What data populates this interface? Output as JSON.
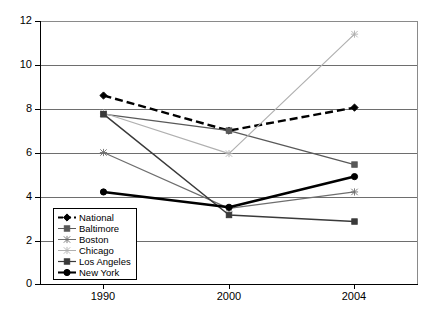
{
  "chart_data": {
    "type": "line",
    "title": "",
    "xlabel": "",
    "ylabel": "",
    "categories": [
      "1990",
      "2000",
      "2004"
    ],
    "ylim": [
      0,
      12
    ],
    "yticks": [
      0,
      2,
      4,
      6,
      8,
      10,
      12
    ],
    "ytick_labels": [
      "0",
      "2",
      "4",
      "6",
      "8",
      "10",
      "12"
    ],
    "grid": true,
    "grid_axis": "y",
    "legend_position": "lower-left-inside",
    "series": [
      {
        "name": "National",
        "values": [
          8.6,
          7.0,
          8.05
        ],
        "color": "#000000",
        "line_style": "dashed",
        "line_width": 2.4,
        "marker": "diamond"
      },
      {
        "name": "Baltimore",
        "values": [
          7.75,
          7.0,
          5.45
        ],
        "color": "#595959",
        "line_style": "solid",
        "line_width": 1.3,
        "marker": "square"
      },
      {
        "name": "Boston",
        "values": [
          6.0,
          3.45,
          4.2
        ],
        "color": "#6e6e6e",
        "line_style": "solid",
        "line_width": 1.2,
        "marker": "star"
      },
      {
        "name": "Chicago",
        "values": [
          7.8,
          5.95,
          11.4
        ],
        "color": "#b0b0b0",
        "line_style": "solid",
        "line_width": 1.2,
        "marker": "star"
      },
      {
        "name": "Los Angeles",
        "values": [
          7.75,
          3.15,
          2.85
        ],
        "color": "#3a3a3a",
        "line_style": "solid",
        "line_width": 1.5,
        "marker": "square"
      },
      {
        "name": "New York",
        "values": [
          4.2,
          3.5,
          4.9
        ],
        "color": "#000000",
        "line_style": "solid",
        "line_width": 2.6,
        "marker": "circle"
      }
    ]
  },
  "legend": {
    "items": [
      {
        "label": "National"
      },
      {
        "label": "Baltimore"
      },
      {
        "label": "Boston"
      },
      {
        "label": "Chicago"
      },
      {
        "label": "Los Angeles"
      },
      {
        "label": "New York"
      }
    ]
  },
  "axes": {
    "y_tick_labels": [
      "12",
      "10",
      "8",
      "6",
      "4",
      "2",
      "0"
    ],
    "x_tick_labels": [
      "1990",
      "2000",
      "2004"
    ]
  }
}
